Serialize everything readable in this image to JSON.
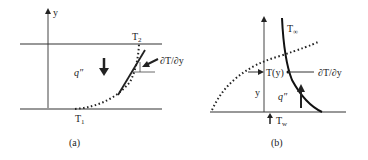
{
  "panel_a": {
    "caption": "(a)",
    "axis_label": "y",
    "top_temp": "T",
    "top_temp_sub": "2",
    "bottom_temp": "T",
    "bottom_temp_sub": "1",
    "heat_flux": "q″",
    "gradient_label": "∂T/∂y"
  },
  "panel_b": {
    "caption": "(b)",
    "axis_label": "y",
    "free_temp": "T",
    "free_temp_sub": "∞",
    "local_temp": "T(y)",
    "heat_flux": "q″",
    "gradient_label": "∂T/∂y",
    "wall_temp": "T",
    "wall_temp_sub": "w"
  },
  "colors": {
    "line": "#222222",
    "thin_line": "#444444"
  }
}
